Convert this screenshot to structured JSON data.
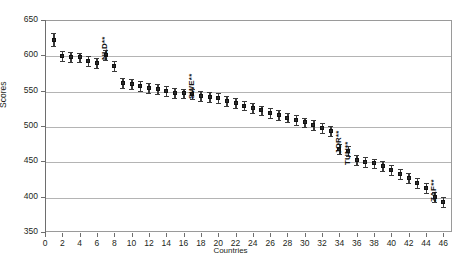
{
  "top_strip_text": "",
  "chart_data": {
    "type": "scatter",
    "title": "",
    "xlabel": "Countries",
    "ylabel": "Scores",
    "xlim": [
      0,
      47
    ],
    "ylim": [
      350,
      650
    ],
    "ytick_values": [
      350,
      400,
      450,
      500,
      550,
      600,
      650
    ],
    "xtick_values": [
      0,
      2,
      4,
      6,
      8,
      10,
      12,
      14,
      16,
      18,
      20,
      22,
      24,
      26,
      28,
      30,
      32,
      34,
      36,
      38,
      40,
      42,
      44,
      46
    ],
    "grid": "horizontal",
    "legend": "none",
    "marker": "square-with-error-bars",
    "x": [
      1,
      2,
      3,
      4,
      5,
      6,
      7,
      8,
      9,
      10,
      11,
      12,
      13,
      14,
      15,
      16,
      17,
      18,
      19,
      20,
      21,
      22,
      23,
      24,
      25,
      26,
      27,
      28,
      29,
      30,
      31,
      32,
      33,
      34,
      35,
      36,
      37,
      38,
      39,
      40,
      41,
      42,
      43,
      44,
      45,
      46
    ],
    "values": [
      622,
      599,
      598,
      597,
      592,
      589,
      600,
      585,
      561,
      560,
      556,
      554,
      552,
      550,
      547,
      546,
      545,
      543,
      541,
      539,
      536,
      532,
      529,
      525,
      522,
      519,
      515,
      512,
      508,
      505,
      501,
      497,
      493,
      468,
      464,
      452,
      449,
      447,
      443,
      438,
      432,
      427,
      419,
      412,
      400,
      393
    ],
    "error_low": [
      613,
      592,
      591,
      590,
      585,
      582,
      593,
      578,
      554,
      553,
      549,
      547,
      545,
      543,
      540,
      539,
      538,
      536,
      534,
      532,
      529,
      525,
      522,
      518,
      515,
      512,
      508,
      505,
      501,
      498,
      494,
      490,
      486,
      461,
      457,
      445,
      442,
      440,
      436,
      431,
      425,
      420,
      412,
      405,
      393,
      386
    ],
    "error_high": [
      631,
      606,
      605,
      604,
      599,
      596,
      607,
      592,
      568,
      567,
      563,
      561,
      559,
      557,
      554,
      553,
      552,
      550,
      548,
      546,
      543,
      539,
      536,
      532,
      529,
      526,
      522,
      519,
      515,
      512,
      508,
      504,
      500,
      475,
      471,
      459,
      456,
      454,
      450,
      445,
      439,
      434,
      426,
      419,
      407,
      400
    ],
    "annotations": [
      {
        "label": "NLD**",
        "x": 7,
        "y": 600
      },
      {
        "label": "SWE**",
        "x": 17,
        "y": 545
      },
      {
        "label": "JOR**",
        "x": 34,
        "y": 468
      },
      {
        "label": "TUN**",
        "x": 35,
        "y": 452
      },
      {
        "label": "ZAF**",
        "x": 45,
        "y": 400
      }
    ]
  }
}
